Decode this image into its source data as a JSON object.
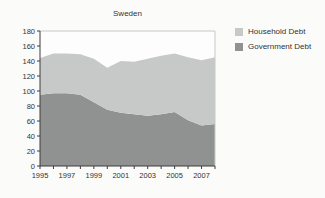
{
  "chart_data": {
    "type": "area",
    "stacked": true,
    "title": "Sweden",
    "x": [
      1995,
      1996,
      1997,
      1998,
      1999,
      2000,
      2001,
      2002,
      2003,
      2004,
      2005,
      2006,
      2007,
      2008
    ],
    "x_tick_labels": [
      "1995",
      "1997",
      "1999",
      "2001",
      "2003",
      "2005",
      "2007"
    ],
    "ylim": [
      0,
      180
    ],
    "y_tick_step": 20,
    "grid": false,
    "legend_position": "top-right",
    "series": [
      {
        "name": "Government Debt",
        "color": "#8f9291",
        "values": [
          95,
          97,
          97,
          95,
          85,
          75,
          71,
          69,
          67,
          69,
          72,
          61,
          54,
          56
        ]
      },
      {
        "name": "Household Debt",
        "color": "#c7c9c8",
        "values": [
          49,
          53,
          53,
          54,
          58,
          56,
          69,
          70,
          76,
          78,
          78,
          84,
          87,
          89
        ]
      }
    ]
  },
  "colors": {
    "page_background": "#fbfbfa",
    "plot_background": "#fdfdfd",
    "plot_border": "#c8c8c6",
    "axis": "#3c3c3c",
    "text": "#333333"
  }
}
